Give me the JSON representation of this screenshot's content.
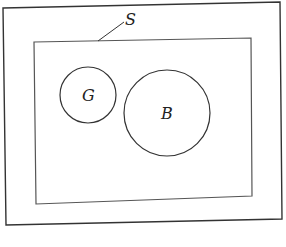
{
  "diagram": {
    "type": "venn",
    "outer_set": {
      "label": "S"
    },
    "sets": [
      {
        "label": "G",
        "cx": 88,
        "cy": 95,
        "r": 28
      },
      {
        "label": "B",
        "cx": 167,
        "cy": 113,
        "r": 43
      }
    ],
    "colors": {
      "stroke": "#333333",
      "background": "#ffffff"
    }
  }
}
